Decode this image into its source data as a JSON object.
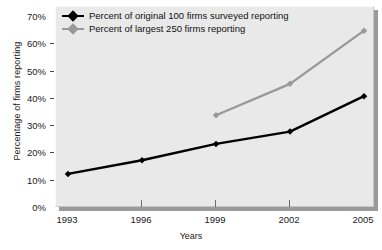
{
  "chart_data": {
    "type": "line",
    "title": "",
    "xlabel": "Years",
    "ylabel": "Percentage of firms reporting",
    "categories": [
      "1993",
      "1996",
      "1999",
      "2002",
      "2005"
    ],
    "x": [
      1993,
      1996,
      1999,
      2002,
      2005
    ],
    "xlim": [
      1993,
      2005
    ],
    "ylim": [
      0,
      70
    ],
    "ytick_labels": [
      "0%",
      "10%",
      "20%",
      "30%",
      "40%",
      "50%",
      "60%",
      "70%"
    ],
    "ytick_values": [
      0,
      10,
      20,
      30,
      40,
      50,
      60,
      70
    ],
    "grid": false,
    "legend_position": "top-left",
    "series": [
      {
        "name": "Percent of original 100 firms surveyed reporting",
        "color": "#000000",
        "marker": "diamond",
        "values": [
          12.5,
          17.5,
          23.5,
          28,
          41
        ]
      },
      {
        "name": "Percent of largest 250 firms reporting",
        "color": "#999999",
        "marker": "diamond",
        "values": [
          null,
          null,
          34,
          45.5,
          65
        ]
      }
    ]
  },
  "axes": {
    "y_title": "Percentage of firms reporting",
    "x_title": "Years"
  },
  "legend": {
    "items": [
      {
        "label": "Percent of original 100 firms surveyed reporting",
        "color": "#000000"
      },
      {
        "label": "Percent of largest 250 firms reporting",
        "color": "#999999"
      }
    ]
  },
  "colors": {
    "series_1": "#000000",
    "series_2": "#999999",
    "plot_background": "#e9e9e9",
    "shadow": "#9a9a9a",
    "text": "#1a1a1a"
  }
}
